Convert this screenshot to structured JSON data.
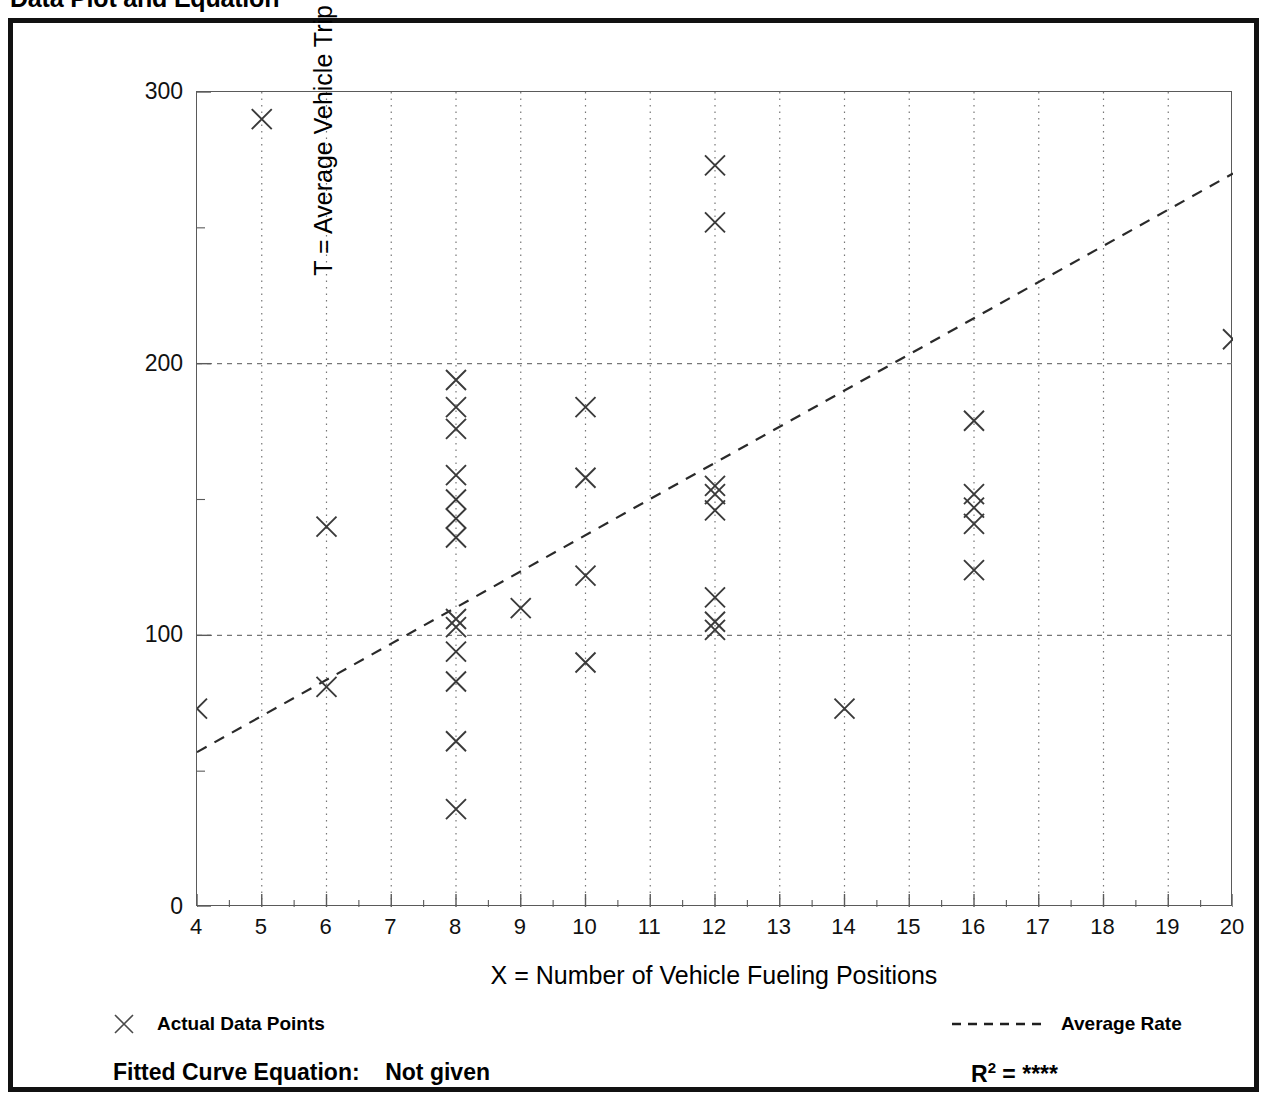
{
  "title": "Data Plot and Equation",
  "axes": {
    "x_title": "X = Number of Vehicle Fueling Positions",
    "y_title": "T = Average Vehicle Trip Ends",
    "x_ticks": [
      "4",
      "5",
      "6",
      "7",
      "8",
      "9",
      "10",
      "11",
      "12",
      "13",
      "14",
      "15",
      "16",
      "17",
      "18",
      "19",
      "20"
    ],
    "y_ticks": [
      "0",
      "100",
      "200",
      "300"
    ]
  },
  "legend": {
    "points_label": "Actual Data Points",
    "points_marker": "x-marker-icon",
    "line_label": "Average Rate",
    "line_marker": "dashed-line-icon"
  },
  "footer": {
    "equation_label": "Fitted Curve Equation:",
    "equation_value": "Not given",
    "rsquared_label": "R",
    "rsquared_exponent": "2",
    "rsquared_equals": "=",
    "rsquared_value": "****"
  },
  "colors": {
    "frame": "#111111",
    "axis": "#5a5a5a",
    "grid": "#777777",
    "marker": "#3a3a3a",
    "trend": "#2a2a2a",
    "background": "#ffffff"
  },
  "chart_data": {
    "type": "scatter",
    "title": "Data Plot and Equation",
    "xlabel": "X = Number of Vehicle Fueling Positions",
    "ylabel": "T = Average Vehicle Trip Ends",
    "xlim": [
      4,
      20
    ],
    "ylim": [
      0,
      300
    ],
    "x_major_ticks": [
      4,
      5,
      6,
      7,
      8,
      9,
      10,
      11,
      12,
      13,
      14,
      15,
      16,
      17,
      18,
      19,
      20
    ],
    "y_major_ticks": [
      0,
      100,
      200,
      300
    ],
    "y_minor_ticks": [
      50,
      150,
      250
    ],
    "grid": "vertical dotted at every integer x; horizontal dashed at 100 and 200",
    "legend_position": "below-plot",
    "series": [
      {
        "name": "Actual Data Points",
        "type": "scatter",
        "marker": "x",
        "points": [
          [
            4,
            73
          ],
          [
            5,
            290
          ],
          [
            6,
            140
          ],
          [
            6,
            81
          ],
          [
            8,
            194
          ],
          [
            8,
            184
          ],
          [
            8,
            176
          ],
          [
            8,
            159
          ],
          [
            8,
            150
          ],
          [
            8,
            143
          ],
          [
            8,
            136
          ],
          [
            8,
            106
          ],
          [
            8,
            103
          ],
          [
            8,
            94
          ],
          [
            8,
            83
          ],
          [
            8,
            61
          ],
          [
            8,
            36
          ],
          [
            9,
            110
          ],
          [
            10,
            184
          ],
          [
            10,
            158
          ],
          [
            10,
            122
          ],
          [
            10,
            90
          ],
          [
            12,
            273
          ],
          [
            12,
            252
          ],
          [
            12,
            155
          ],
          [
            12,
            152
          ],
          [
            12,
            146
          ],
          [
            12,
            114
          ],
          [
            12,
            105
          ],
          [
            12,
            102
          ],
          [
            14,
            73
          ],
          [
            16,
            179
          ],
          [
            16,
            152
          ],
          [
            16,
            147
          ],
          [
            16,
            141
          ],
          [
            16,
            124
          ],
          [
            20,
            209
          ]
        ]
      },
      {
        "name": "Average Rate",
        "type": "line",
        "style": "dashed",
        "points": [
          [
            4,
            57
          ],
          [
            20,
            270
          ]
        ]
      }
    ]
  }
}
